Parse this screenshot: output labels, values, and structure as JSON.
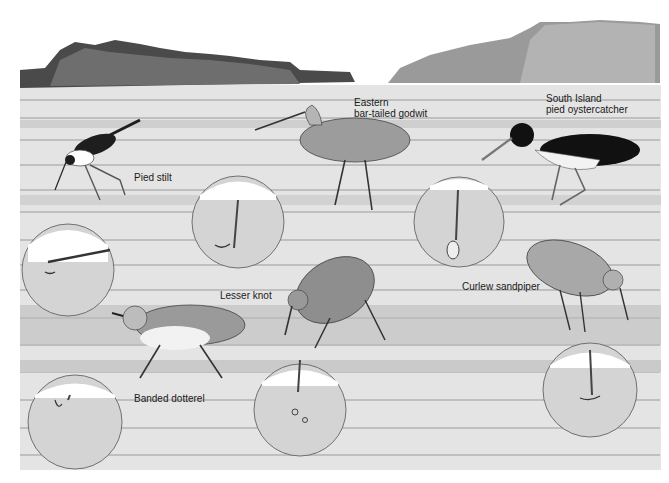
{
  "illustration": {
    "subject": "Shorebirds feeding on tidal mudflat with bill-probing insets",
    "labels": {
      "pied_stilt": "Pied stilt",
      "godwit_line1": "Eastern",
      "godwit_line2": "bar-tailed godwit",
      "oystercatcher_line1": "South Island",
      "oystercatcher_line2": "pied oystercatcher",
      "lesser_knot": "Lesser knot",
      "curlew_sandpiper": "Curlew sandpiper",
      "banded_dotterel": "Banded dotterel"
    },
    "colors": {
      "sky": "#ffffff",
      "mud_light": "#e2e2e2",
      "mud_mid": "#c8c8c8",
      "mud_dark": "#9a9a9a",
      "ink": "#1a1a1a",
      "bird_grey": "#8a8a8a",
      "inset_fill": "#d4d4d4"
    }
  }
}
